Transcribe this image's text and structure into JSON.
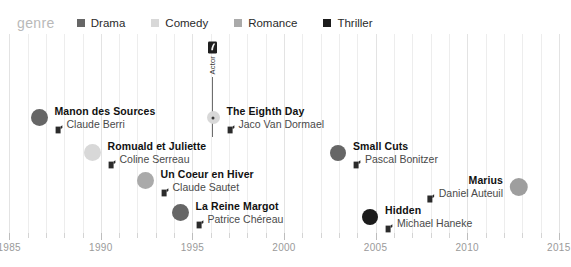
{
  "legend": {
    "title": "genre",
    "items": [
      {
        "label": "Drama",
        "color": "#666666"
      },
      {
        "label": "Comedy",
        "color": "#d8d8d8"
      },
      {
        "label": "Romance",
        "color": "#aaaaaa"
      },
      {
        "label": "Thriller",
        "color": "#1c1c1c"
      }
    ]
  },
  "callout": {
    "icon_name": "actor-icon",
    "label": "Actor",
    "x": 213,
    "icon_top": 6,
    "line_height": 60
  },
  "axis": {
    "labels": [
      "1985",
      "1990",
      "1995",
      "2000",
      "2005",
      "2010",
      "2015"
    ],
    "x_min": 1984.5,
    "x_max": 2015.5,
    "tick_step": 1,
    "major_step": 5
  },
  "chart_data": {
    "type": "scatter",
    "title": "genre",
    "xlabel": "",
    "ylabel": "",
    "xlim": [
      1984.5,
      2015.5
    ],
    "grid": true,
    "legend_position": "top",
    "legend_entries": [
      "Drama",
      "Comedy",
      "Romance",
      "Thriller"
    ],
    "annotations": [
      "Actor"
    ],
    "points": [
      {
        "title": "Manon des Sources",
        "director": "Claude Berri",
        "genre": "Drama",
        "color": "#666666",
        "year": 1986,
        "x": 39,
        "y": 83,
        "size": 17,
        "align": "left",
        "center_dot": false
      },
      {
        "title": "The Eighth Day",
        "director": "Jaco Van Dormael",
        "genre": "Comedy",
        "color": "#d8d8d8",
        "year": 1996,
        "x": 213,
        "y": 83,
        "size": 13,
        "align": "left",
        "center_dot": true
      },
      {
        "title": "Romuald et Juliette",
        "director": "Coline Serreau",
        "genre": "Comedy",
        "color": "#d8d8d8",
        "year": 1989,
        "x": 92,
        "y": 118,
        "size": 17,
        "align": "left",
        "center_dot": false
      },
      {
        "title": "Small Cuts",
        "director": "Pascal Bonitzer",
        "genre": "Drama",
        "color": "#666666",
        "year": 2004,
        "x": 338,
        "y": 118,
        "size": 16,
        "align": "left",
        "center_dot": false
      },
      {
        "title": "Un Coeur en Hiver",
        "director": "Claude Sautet",
        "genre": "Romance",
        "color": "#aaaaaa",
        "year": 1992,
        "x": 145,
        "y": 146,
        "size": 17,
        "align": "left",
        "center_dot": false
      },
      {
        "title": "Marius",
        "director": "Daniel Auteuil",
        "genre": "Romance",
        "color": "#9e9e9e",
        "year": 2013,
        "x": 519,
        "y": 152,
        "size": 18,
        "align": "right",
        "center_dot": false
      },
      {
        "title": "La Reine Margot",
        "director": "Patrice Chéreau",
        "genre": "Drama",
        "color": "#666666",
        "year": 1994,
        "x": 180,
        "y": 178,
        "size": 17,
        "align": "left",
        "center_dot": false
      },
      {
        "title": "Hidden",
        "director": "Michael Haneke",
        "genre": "Thriller",
        "color": "#1c1c1c",
        "year": 2005,
        "x": 370,
        "y": 182,
        "size": 16,
        "align": "left",
        "center_dot": false
      }
    ]
  }
}
